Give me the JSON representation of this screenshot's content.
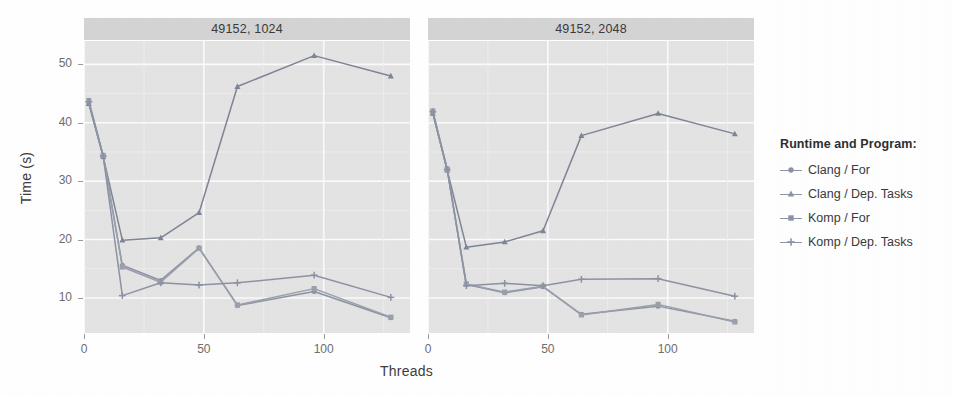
{
  "chart_data": {
    "type": "line",
    "title": "",
    "xlabel": "Threads",
    "ylabel": "Time (s)",
    "xlim": [
      0,
      136
    ],
    "ylim": [
      4,
      54
    ],
    "xticks": [
      0,
      50,
      100
    ],
    "yticks": [
      10,
      20,
      30,
      40,
      50
    ],
    "grid": true,
    "legend_title": "Runtime and Program:",
    "legend_position": "right",
    "facets": [
      {
        "label": "49152, 1024",
        "series": [
          {
            "name": "Clang / For",
            "marker": "circle",
            "color": "#8d93a4",
            "x": [
              2,
              8,
              16,
              32,
              48,
              64,
              96,
              128
            ],
            "y": [
              43.5,
              34.3,
              15.6,
              13.0,
              18.6,
              8.7,
              11.1,
              6.6
            ]
          },
          {
            "name": "Clang / Dep. Tasks",
            "marker": "triangle",
            "color": "#7e8596",
            "x": [
              2,
              8,
              16,
              32,
              48,
              64,
              96,
              128
            ],
            "y": [
              43.3,
              34.2,
              19.9,
              20.3,
              24.6,
              46.2,
              51.5,
              48.0
            ]
          },
          {
            "name": "Komp / For",
            "marker": "square",
            "color": "#9aa0ad",
            "x": [
              2,
              8,
              16,
              32,
              48,
              64,
              96,
              128
            ],
            "y": [
              43.8,
              34.4,
              15.3,
              12.7,
              18.5,
              8.8,
              11.6,
              6.7
            ]
          },
          {
            "name": "Komp / Dep. Tasks",
            "marker": "plus",
            "color": "#8d93a4",
            "x": [
              2,
              8,
              16,
              32,
              48,
              64,
              96,
              128
            ],
            "y": [
              43.6,
              34.3,
              10.4,
              12.6,
              12.2,
              12.6,
              13.9,
              10.1
            ]
          }
        ]
      },
      {
        "label": "49152, 2048",
        "series": [
          {
            "name": "Clang / For",
            "marker": "circle",
            "color": "#8d93a4",
            "x": [
              2,
              8,
              16,
              32,
              48,
              64,
              96,
              128
            ],
            "y": [
              41.8,
              32.0,
              12.3,
              10.9,
              11.9,
              7.2,
              8.6,
              6.0
            ]
          },
          {
            "name": "Clang / Dep. Tasks",
            "marker": "triangle",
            "color": "#7e8596",
            "x": [
              2,
              8,
              16,
              32,
              48,
              64,
              96,
              128
            ],
            "y": [
              41.6,
              31.9,
              18.7,
              19.6,
              21.5,
              37.8,
              41.6,
              38.1
            ]
          },
          {
            "name": "Komp / For",
            "marker": "square",
            "color": "#9aa0ad",
            "x": [
              2,
              8,
              16,
              32,
              48,
              64,
              96,
              128
            ],
            "y": [
              42.0,
              32.1,
              12.4,
              11.0,
              12.0,
              7.1,
              8.9,
              5.9
            ]
          },
          {
            "name": "Komp / Dep. Tasks",
            "marker": "plus",
            "color": "#8d93a4",
            "x": [
              2,
              8,
              16,
              32,
              48,
              64,
              96,
              128
            ],
            "y": [
              41.9,
              32.0,
              12.1,
              12.5,
              12.1,
              13.2,
              13.3,
              10.3
            ]
          }
        ]
      }
    ]
  },
  "axes": {
    "y_title": "Time (s)",
    "x_title": "Threads",
    "y_tick_labels": [
      "50",
      "40",
      "30",
      "20",
      "10"
    ],
    "x_tick_labels": [
      "0",
      "50",
      "100"
    ]
  },
  "panels": [
    {
      "strip_label": "49152, 1024"
    },
    {
      "strip_label": "49152, 2048"
    }
  ],
  "legend": {
    "title": "Runtime and Program:",
    "items": [
      {
        "label": "Clang / For",
        "marker": "circle"
      },
      {
        "label": "Clang / Dep. Tasks",
        "marker": "triangle"
      },
      {
        "label": "Komp / For",
        "marker": "square"
      },
      {
        "label": "Komp / Dep. Tasks",
        "marker": "plus"
      }
    ]
  },
  "style": {
    "panel_bg": "#e4e4e4",
    "strip_bg": "#d4d4d4",
    "grid_major": "#fbfbfb",
    "line_color": "#8d93a4"
  }
}
